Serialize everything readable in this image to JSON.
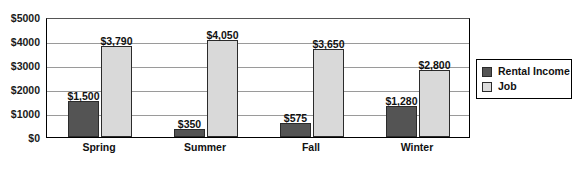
{
  "chart_data": {
    "type": "bar",
    "title": "",
    "subtitle": "",
    "xlabel": "",
    "ylabel": "",
    "categories": [
      "Spring",
      "Summer",
      "Fall",
      "Winter"
    ],
    "series": [
      {
        "name": "Rental Income",
        "color": "#545454",
        "values": [
          1500,
          350,
          575,
          1280
        ],
        "labels": [
          "$1,500",
          "$350",
          "$575",
          "$1,280"
        ]
      },
      {
        "name": "Job",
        "color": "#d9d9d9",
        "values": [
          3790,
          4050,
          3650,
          2800
        ],
        "labels": [
          "$3,790",
          "$4,050",
          "$3,650",
          "$2,800"
        ]
      }
    ],
    "ylim": [
      0,
      5000
    ],
    "yticks": [
      0,
      1000,
      2000,
      3000,
      4000,
      5000
    ],
    "ytick_labels": [
      "$0",
      "$1000",
      "$2000",
      "$3000",
      "$4000",
      "$5000"
    ],
    "grid": true,
    "legend_position": "right",
    "legend_entries": [
      "Rental Income",
      "Job"
    ]
  },
  "legend": {
    "items": [
      {
        "label": "Rental Income"
      },
      {
        "label": "Job"
      }
    ]
  }
}
